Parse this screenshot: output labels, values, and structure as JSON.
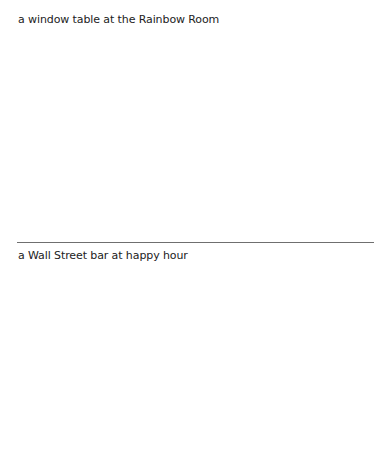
{
  "sections": [
    {
      "caption": "a window table at the Rainbow Room"
    },
    {
      "caption": "a Wall Street bar at happy hour"
    }
  ],
  "colors": {
    "background": "#ffffff",
    "text": "#222222",
    "divider": "#6f6f6f"
  }
}
